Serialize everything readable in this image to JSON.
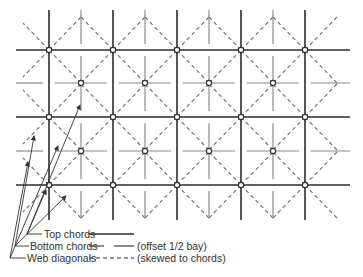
{
  "diagram": {
    "colors": {
      "top_chord": "#2b2b2b",
      "bottom_chord": "#8a8a8a",
      "web": "#6e6e6e",
      "arrow": "#333333",
      "node_fill": "#ffffff"
    },
    "grid": {
      "top_nodes_x": [
        49,
        113,
        177,
        241,
        305
      ],
      "top_rows_y": [
        50,
        117,
        185
      ],
      "bottom_nodes_x": [
        81,
        145,
        209,
        273
      ],
      "bottom_rows_y": [
        83,
        151
      ],
      "top_chord_x_range": [
        16,
        350
      ],
      "top_chord_y_range": [
        10,
        220
      ],
      "bottom_chord_x_range": [
        16,
        350
      ],
      "bottom_vertical_y_range": [
        10,
        218
      ],
      "gap": 6
    }
  },
  "legend": {
    "items": [
      {
        "label": "Top chords",
        "note": "",
        "style": "solid"
      },
      {
        "label": "Bottom chords",
        "note": "(offset 1/2 bay)",
        "style": "broken"
      },
      {
        "label": "Web diagonals",
        "note": "(skewed to chords)",
        "style": "dashed"
      }
    ]
  }
}
